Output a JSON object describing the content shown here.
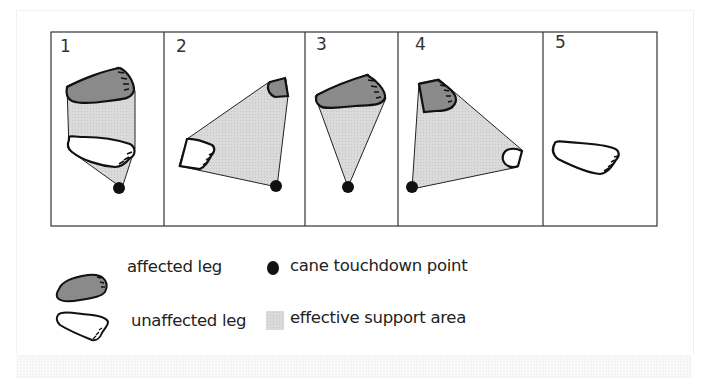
{
  "figure": {
    "panels": [
      {
        "number": "1",
        "label": "panel-1"
      },
      {
        "number": "2",
        "label": "panel-2"
      },
      {
        "number": "3",
        "label": "panel-3"
      },
      {
        "number": "4",
        "label": "panel-4"
      },
      {
        "number": "5",
        "label": "panel-5"
      }
    ],
    "colors": {
      "affected_foot": "#8a8a8a",
      "unaffected_foot": "#ffffff",
      "support_area": "#d9d9d9",
      "cane_point": "#111111",
      "outline": "#111111",
      "frame": "#333333"
    }
  },
  "legend": {
    "affected": "affected leg",
    "unaffected": "unaffected leg",
    "cane": "cane touchdown point",
    "support": "effective support area"
  }
}
